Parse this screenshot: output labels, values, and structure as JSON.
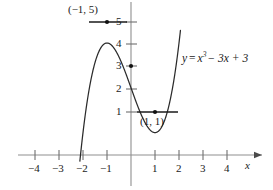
{
  "figure": {
    "kind": "cartesian-plot",
    "width": 273,
    "height": 190,
    "background_color": "#ffffff",
    "ink_color": "#1a1a1a",
    "axis_color": "#8a8a8a"
  },
  "equation_label": {
    "lhs": "y",
    "equals": "=",
    "base": "x",
    "exponent": "3",
    "rest": "− 3x + 3",
    "full_text": "y = x³ − 3x + 3"
  },
  "annotations": {
    "maximum_label": "(−1, 5)",
    "minimum_label": "(1, 1)"
  },
  "axes": {
    "x_axis_name": "x",
    "x_ticks": [
      {
        "label": "−4",
        "value": -4
      },
      {
        "label": "−3",
        "value": -3
      },
      {
        "label": "−2",
        "value": -2
      },
      {
        "label": "−1",
        "value": -1
      },
      {
        "label": "1",
        "value": 1
      },
      {
        "label": "2",
        "value": 2
      },
      {
        "label": "3",
        "value": 3
      },
      {
        "label": "4",
        "value": 4
      }
    ],
    "y_ticks": [
      {
        "label": "5",
        "value": 5
      },
      {
        "label": "4",
        "value": 4
      },
      {
        "label": "3",
        "value": 3
      },
      {
        "label": "2",
        "value": 2
      },
      {
        "label": "1",
        "value": 1
      }
    ]
  },
  "chart_data": {
    "type": "line",
    "title": "",
    "xlabel": "x",
    "ylabel": "",
    "xlim": [
      -4.7,
      4.9
    ],
    "ylim": [
      -1.4,
      6.2
    ],
    "grid": false,
    "legend": null,
    "series": [
      {
        "name": "y = x³ − 3x + 3",
        "function": "x^3 - 3x + 3",
        "color": "#1a1a1a",
        "x": [
          -2.15,
          -2.1,
          -2.0,
          -1.9,
          -1.8,
          -1.7,
          -1.6,
          -1.5,
          -1.4,
          -1.3,
          -1.2,
          -1.1,
          -1.0,
          -0.9,
          -0.8,
          -0.7,
          -0.6,
          -0.5,
          -0.4,
          -0.3,
          -0.2,
          -0.1,
          0.0,
          0.1,
          0.2,
          0.3,
          0.4,
          0.5,
          0.6,
          0.7,
          0.8,
          0.9,
          1.0,
          1.1,
          1.2,
          1.3,
          1.4,
          1.5,
          1.6,
          1.7,
          1.8,
          1.9,
          2.0,
          2.05
        ],
        "y": [
          -0.49,
          -0.16,
          1.0,
          2.84,
          2.57,
          3.19,
          3.7,
          4.13,
          4.46,
          4.7,
          4.87,
          4.97,
          5.0,
          4.97,
          4.89,
          4.76,
          4.58,
          4.38,
          4.14,
          3.87,
          3.59,
          3.3,
          3.0,
          2.7,
          2.41,
          2.13,
          1.86,
          1.63,
          1.42,
          1.24,
          1.09,
          1.03,
          1.0,
          1.03,
          1.13,
          1.3,
          1.54,
          1.88,
          2.3,
          2.81,
          3.43,
          4.16,
          5.0,
          5.47
        ]
      }
    ],
    "marked_points": [
      {
        "label": "(−1, 5)",
        "x": -1,
        "y": 5,
        "type": "local-maximum",
        "tangent": "horizontal"
      },
      {
        "label": "",
        "x": 0,
        "y": 3,
        "type": "y-intercept",
        "tangent": "none"
      },
      {
        "label": "(1, 1)",
        "x": 1,
        "y": 1,
        "type": "local-minimum",
        "tangent": "horizontal"
      }
    ],
    "tangent_segments": [
      {
        "at_point": [
          -1,
          5
        ],
        "x_from": -1.75,
        "x_to": -0.15,
        "y": 5
      },
      {
        "at_point": [
          1,
          1
        ],
        "x_from": 0.25,
        "x_to": 1.95,
        "y": 1
      }
    ]
  }
}
